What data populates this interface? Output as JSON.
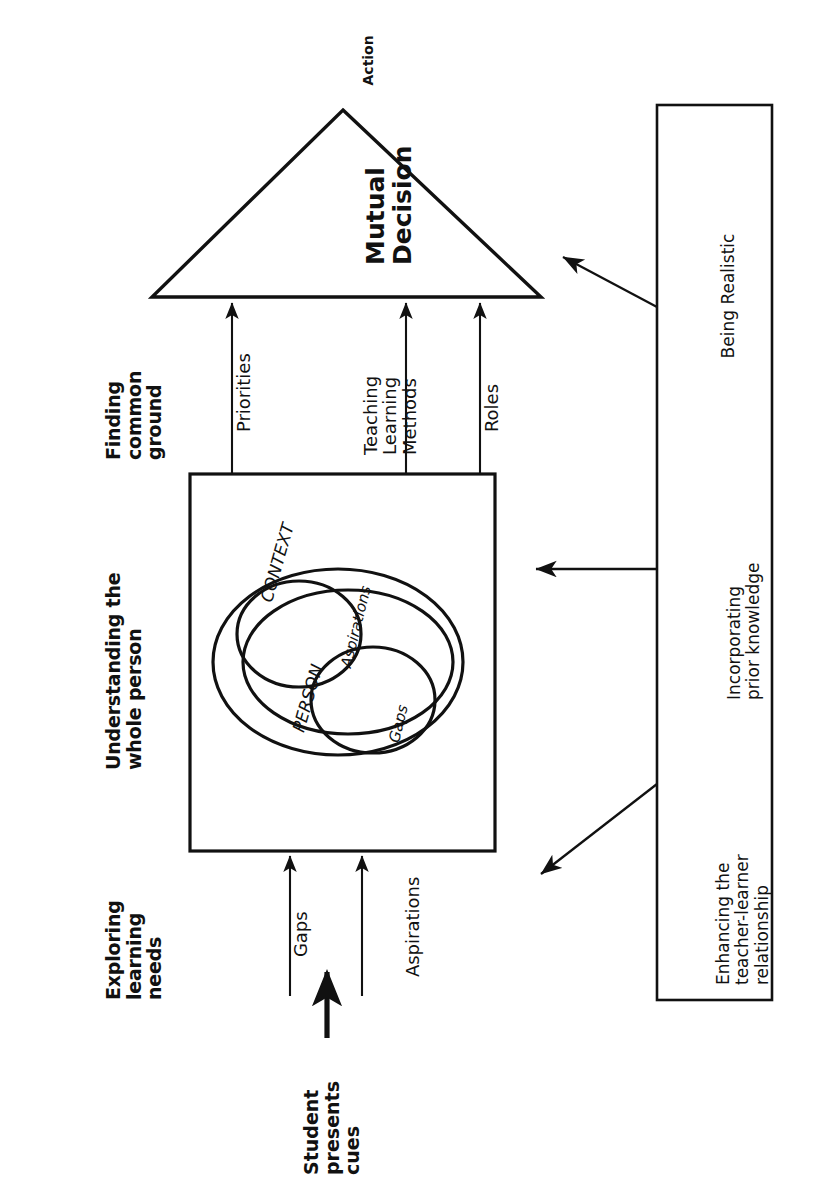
{
  "figure": {
    "orientation": "rotated-90-ccw"
  },
  "stage_headers": [
    {
      "id": "exploring",
      "label": "Exploring\nlearning\nneeds"
    },
    {
      "id": "understanding",
      "label": "Understanding the\nwhole person"
    },
    {
      "id": "finding",
      "label": "Finding\ncommon\nground"
    }
  ],
  "apex": {
    "triangle_label": "Mutual\nDecision",
    "outcome_label": "Action"
  },
  "person_box": {
    "context_label": "CONTEXT",
    "person_label": "PERSON",
    "aspirations_label": "Aspirations",
    "gaps_label": "Gaps"
  },
  "input_arrows": [
    {
      "id": "gaps-in",
      "label": "Gaps"
    },
    {
      "id": "aspirations-in",
      "label": "Aspirations"
    }
  ],
  "student_source": {
    "label": "Student\npresents\ncues"
  },
  "output_arrows": [
    {
      "id": "priorities",
      "label": "Priorities"
    },
    {
      "id": "methods",
      "label": "Teaching\nLearning\nMethods"
    },
    {
      "id": "roles",
      "label": "Roles"
    }
  ],
  "process_box": {
    "items": [
      {
        "id": "relationship",
        "label": "Enhancing the\nteacher-learner\nrelationship"
      },
      {
        "id": "prior-knowledge",
        "label": "Incorporating\nprior knowledge"
      },
      {
        "id": "realistic",
        "label": "Being Realistic"
      }
    ]
  },
  "colors": {
    "ink": "#111111",
    "paper": "#ffffff"
  }
}
